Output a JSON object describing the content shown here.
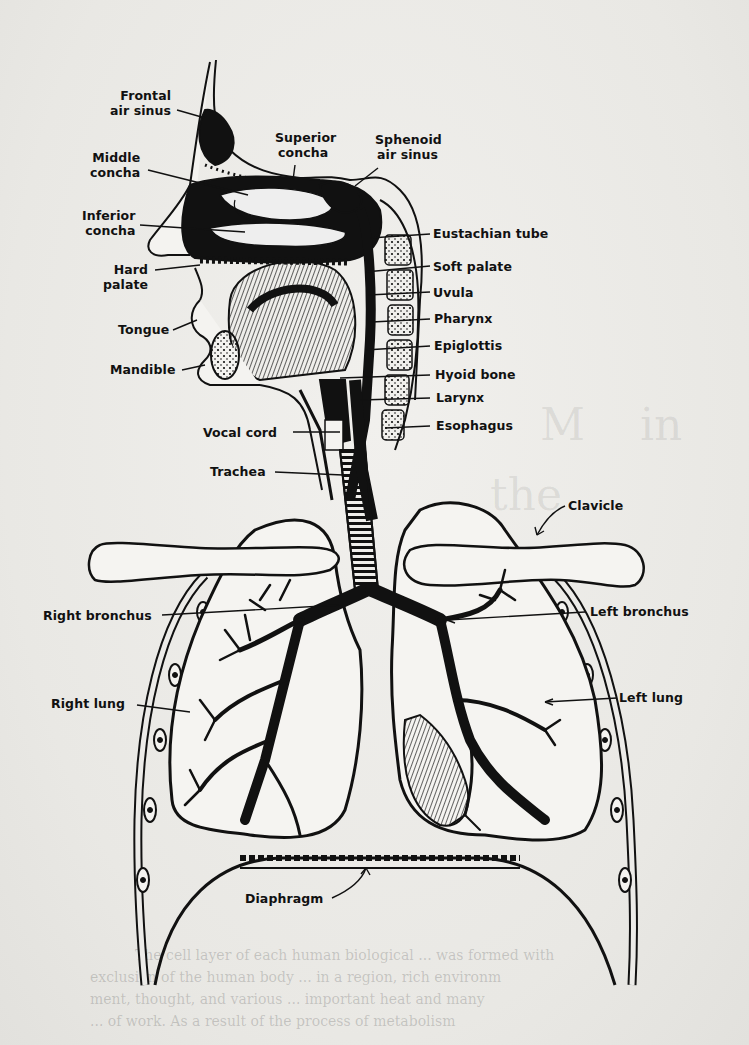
{
  "figure": {
    "labels": {
      "frontal_air_sinus": [
        "Frontal",
        "air sinus"
      ],
      "superior_concha": [
        "Superior",
        "concha"
      ],
      "sphenoid_air_sinus": [
        "Sphenoid",
        "air sinus"
      ],
      "middle_concha": [
        "Middle",
        "concha"
      ],
      "inferior_concha": [
        "Inferior",
        "concha"
      ],
      "hard_palate": [
        "Hard",
        "palate"
      ],
      "tongue": "Tongue",
      "mandible": "Mandible",
      "vocal_cord": "Vocal cord",
      "trachea": "Trachea",
      "eustachian_tube": "Eustachian tube",
      "soft_palate": "Soft palate",
      "uvula": "Uvula",
      "pharynx": "Pharynx",
      "epiglottis": "Epiglottis",
      "hyoid_bone": "Hyoid bone",
      "larynx": "Larynx",
      "esophagus": "Esophagus",
      "clavicle": "Clavicle",
      "right_bronchus": "Right bronchus",
      "left_bronchus": "Left bronchus",
      "right_lung": "Right lung",
      "left_lung": "Left lung",
      "diaphragm": "Diaphragm"
    }
  },
  "bleed_through": {
    "heading": [
      "M",
      "in",
      "the",
      "story"
    ],
    "body_lines": [
      "The cell layer of each human biological ... was formed with",
      "exclusion of the human body ... in a region, rich environm",
      "ment, thought, and various ... important heat and many",
      "... of work. As a result of the process of metabolism"
    ]
  },
  "colors": {
    "ink": "#111111",
    "paper": "#ecebe8"
  }
}
